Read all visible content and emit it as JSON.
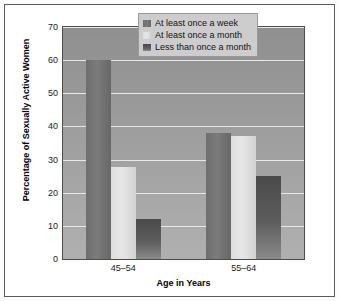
{
  "chart_data": {
    "type": "bar",
    "title": "",
    "xlabel": "Age in Years",
    "ylabel": "Percentage of Sexually Active Women",
    "categories": [
      "45–54",
      "55–64"
    ],
    "series": [
      {
        "name": "At least once a week",
        "values": [
          60,
          38
        ],
        "color": "#757575"
      },
      {
        "name": "At least once a month",
        "values": [
          27.8,
          37
        ],
        "color": "#e0e0e0"
      },
      {
        "name": "Less than once a month",
        "values": [
          12,
          25
        ],
        "color": "#525252"
      }
    ],
    "ylim": [
      0,
      70
    ],
    "yticks": [
      0,
      10,
      20,
      30,
      40,
      50,
      60,
      70
    ],
    "ytick_labels": [
      "0",
      "10",
      "20",
      "30",
      "40",
      "50",
      "60",
      "70"
    ],
    "grid": true,
    "grid_axis": "y",
    "legend_position": "top-right",
    "plot_background": "#9a9a9a",
    "gridline_color": "#e8e8e8",
    "frame_color": "#5a5a5a"
  }
}
